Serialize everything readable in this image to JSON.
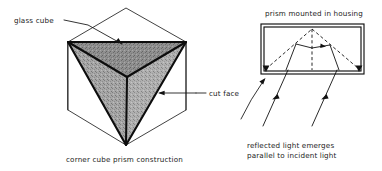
{
  "figure": {
    "background_color": "#ffffff",
    "ink_color": "#111111",
    "shade_color": "#9e9e9e"
  },
  "left_panel": {
    "caption": "corner cube prism construction",
    "labels": {
      "glass_cube": "glass cube",
      "cut_face": "cut face"
    },
    "geometry": {
      "cube_outline_note": "hexagonal silhouette of a cube viewed along its body diagonal",
      "cut_faces_count": 3
    }
  },
  "right_panel": {
    "title": "prism mounted in housing",
    "caption_line_1": "reflected light emerges",
    "caption_line_2": "parallel to incident light",
    "geometry": {
      "housing_shape": "rectangle",
      "internal_construction": "dashed triangle and vertical centre line",
      "ray_count": 2,
      "ray_direction": "upward into prism, reflected downward parallel"
    }
  }
}
